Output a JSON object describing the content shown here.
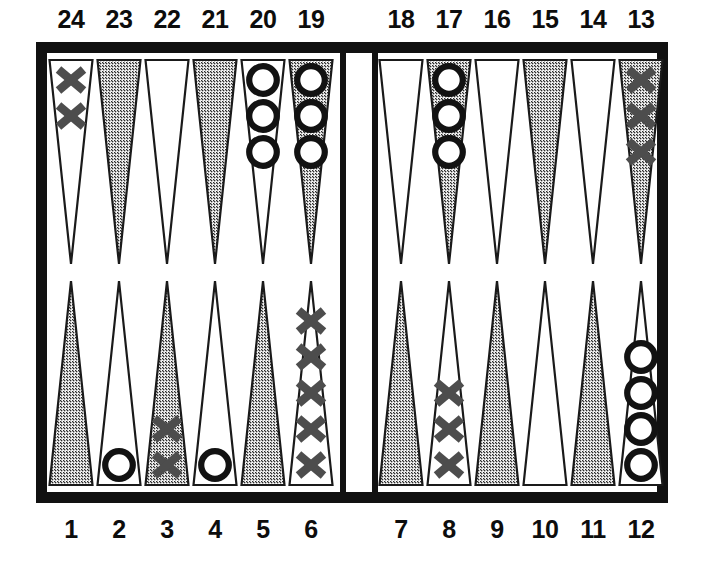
{
  "figure": {
    "kind": "backgammon-board-diagram",
    "width": 704,
    "height": 566,
    "background_color": "#ffffff",
    "frame_color": "#111111",
    "board_surface_color": "#ffffff",
    "shaded_point_color": "#b9b9b9",
    "light_point_color": "#ffffff",
    "point_outline_color": "#1a1a1a",
    "x_checker_color": "#4d4d4d",
    "o_checker_color": "#121212",
    "label_color": "#0d0d0d"
  },
  "labels": {
    "top": [
      "24",
      "23",
      "22",
      "21",
      "20",
      "19",
      "18",
      "17",
      "16",
      "15",
      "14",
      "13"
    ],
    "bottom": [
      "1",
      "2",
      "3",
      "4",
      "5",
      "6",
      "7",
      "8",
      "9",
      "10",
      "11",
      "12"
    ]
  },
  "bar": {
    "present": true,
    "checkers_on_bar": 0
  },
  "chart_data": {
    "type": "table",
    "xlabel": "point number",
    "ylabel": "checkers",
    "legend": [
      "X",
      "O"
    ],
    "categories": [
      "1",
      "2",
      "3",
      "4",
      "5",
      "6",
      "7",
      "8",
      "9",
      "10",
      "11",
      "12",
      "13",
      "14",
      "15",
      "16",
      "17",
      "18",
      "19",
      "20",
      "21",
      "22",
      "23",
      "24"
    ],
    "series": [
      {
        "name": "X",
        "values": [
          0,
          0,
          2,
          0,
          0,
          5,
          0,
          3,
          0,
          0,
          0,
          0,
          3,
          0,
          0,
          0,
          0,
          0,
          0,
          0,
          0,
          0,
          0,
          2
        ]
      },
      {
        "name": "O",
        "values": [
          0,
          1,
          0,
          1,
          0,
          0,
          0,
          0,
          0,
          0,
          0,
          4,
          0,
          0,
          0,
          0,
          3,
          0,
          3,
          3,
          0,
          0,
          0,
          0
        ]
      }
    ],
    "totals": {
      "X": 15,
      "O": 15
    }
  },
  "points": [
    {
      "number": "24",
      "row": "top",
      "side": "left",
      "index": 0,
      "shade": "light",
      "player": "X",
      "count": 2
    },
    {
      "number": "23",
      "row": "top",
      "side": "left",
      "index": 1,
      "shade": "shaded",
      "player": "",
      "count": 0
    },
    {
      "number": "22",
      "row": "top",
      "side": "left",
      "index": 2,
      "shade": "light",
      "player": "",
      "count": 0
    },
    {
      "number": "21",
      "row": "top",
      "side": "left",
      "index": 3,
      "shade": "shaded",
      "player": "",
      "count": 0
    },
    {
      "number": "20",
      "row": "top",
      "side": "left",
      "index": 4,
      "shade": "light",
      "player": "O",
      "count": 3
    },
    {
      "number": "19",
      "row": "top",
      "side": "left",
      "index": 5,
      "shade": "shaded",
      "player": "O",
      "count": 3
    },
    {
      "number": "18",
      "row": "top",
      "side": "right",
      "index": 0,
      "shade": "light",
      "player": "",
      "count": 0
    },
    {
      "number": "17",
      "row": "top",
      "side": "right",
      "index": 1,
      "shade": "shaded",
      "player": "O",
      "count": 3
    },
    {
      "number": "16",
      "row": "top",
      "side": "right",
      "index": 2,
      "shade": "light",
      "player": "",
      "count": 0
    },
    {
      "number": "15",
      "row": "top",
      "side": "right",
      "index": 3,
      "shade": "shaded",
      "player": "",
      "count": 0
    },
    {
      "number": "14",
      "row": "top",
      "side": "right",
      "index": 4,
      "shade": "light",
      "player": "",
      "count": 0
    },
    {
      "number": "13",
      "row": "top",
      "side": "right",
      "index": 5,
      "shade": "shaded",
      "player": "X",
      "count": 3
    },
    {
      "number": "1",
      "row": "bottom",
      "side": "left",
      "index": 0,
      "shade": "shaded",
      "player": "",
      "count": 0
    },
    {
      "number": "2",
      "row": "bottom",
      "side": "left",
      "index": 1,
      "shade": "light",
      "player": "O",
      "count": 1
    },
    {
      "number": "3",
      "row": "bottom",
      "side": "left",
      "index": 2,
      "shade": "shaded",
      "player": "X",
      "count": 2
    },
    {
      "number": "4",
      "row": "bottom",
      "side": "left",
      "index": 3,
      "shade": "light",
      "player": "O",
      "count": 1
    },
    {
      "number": "5",
      "row": "bottom",
      "side": "left",
      "index": 4,
      "shade": "shaded",
      "player": "",
      "count": 0
    },
    {
      "number": "6",
      "row": "bottom",
      "side": "left",
      "index": 5,
      "shade": "light",
      "player": "X",
      "count": 5
    },
    {
      "number": "7",
      "row": "bottom",
      "side": "right",
      "index": 0,
      "shade": "shaded",
      "player": "",
      "count": 0
    },
    {
      "number": "8",
      "row": "bottom",
      "side": "right",
      "index": 1,
      "shade": "light",
      "player": "X",
      "count": 3
    },
    {
      "number": "9",
      "row": "bottom",
      "side": "right",
      "index": 2,
      "shade": "shaded",
      "player": "",
      "count": 0
    },
    {
      "number": "10",
      "row": "bottom",
      "side": "right",
      "index": 3,
      "shade": "light",
      "player": "",
      "count": 0
    },
    {
      "number": "11",
      "row": "bottom",
      "side": "right",
      "index": 4,
      "shade": "shaded",
      "player": "",
      "count": 0
    },
    {
      "number": "12",
      "row": "bottom",
      "side": "right",
      "index": 5,
      "shade": "light",
      "player": "O",
      "count": 4
    }
  ]
}
